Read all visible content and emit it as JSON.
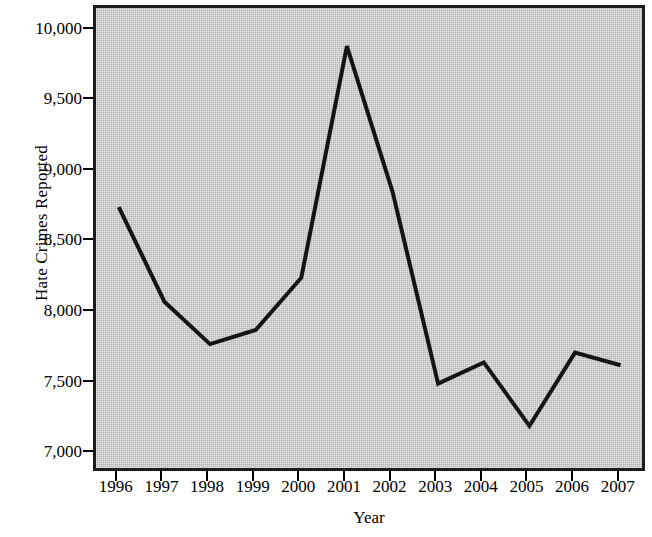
{
  "chart_data": {
    "type": "line",
    "title": "",
    "xlabel": "Year",
    "ylabel": "Hate Crimes Reported",
    "categories": [
      "1996",
      "1997",
      "1998",
      "1999",
      "2000",
      "2001",
      "2002",
      "2003",
      "2004",
      "2005",
      "2006",
      "2007"
    ],
    "x": [
      1996,
      1997,
      1998,
      1999,
      2000,
      2001,
      2002,
      2003,
      2004,
      2005,
      2006,
      2007
    ],
    "values": [
      8750,
      8080,
      7780,
      7880,
      8250,
      9890,
      8860,
      7500,
      7650,
      7200,
      7720,
      7630
    ],
    "series": [
      {
        "name": "Hate Crimes Reported",
        "values": [
          8750,
          8080,
          7780,
          7880,
          8250,
          9890,
          8860,
          7500,
          7650,
          7200,
          7720,
          7630
        ]
      }
    ],
    "ylim": [
      6860,
      10160
    ],
    "xlim": [
      1995.5,
      2007.6
    ],
    "yticks": [
      7000,
      7500,
      8000,
      8500,
      9000,
      9500,
      10000
    ],
    "ytick_labels": [
      "7,000",
      "7,500",
      "8,000",
      "8,500",
      "9,000",
      "9,500",
      "10,000"
    ],
    "xticks": [
      1996,
      1997,
      1998,
      1999,
      2000,
      2001,
      2002,
      2003,
      2004,
      2005,
      2006,
      2007
    ],
    "xtick_labels": [
      "1996",
      "1997",
      "1998",
      "1999",
      "2000",
      "2001",
      "2002",
      "2003",
      "2004",
      "2005",
      "2006",
      "2007"
    ],
    "grid": false,
    "legend": null,
    "colors": {
      "line": "#141414",
      "plot_background": "#bcbcbc",
      "frame": "#1c1c1c",
      "figure_background": "#ffffff",
      "text": "#000000"
    },
    "line_width": 4,
    "markers": false
  }
}
